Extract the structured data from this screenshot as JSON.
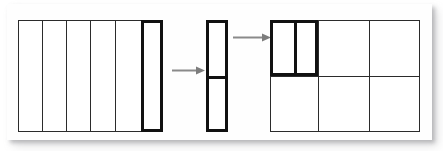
{
  "figure": {
    "title": "",
    "background_color": "#ffffff",
    "frame_color": "#ffffff",
    "line_color": "#2b2b2b",
    "highlight_color": "#111111",
    "arrow_color": "#808080"
  },
  "panels": [
    {
      "id": "panel-left",
      "name": "source-grid-6-columns",
      "x": 18,
      "y": 20,
      "width": 145,
      "height": 112,
      "columns": 6,
      "rows": 1,
      "column_dividers_x": [
        42,
        66,
        90,
        115,
        141
      ],
      "highlighted_cell": {
        "index": 5,
        "x": 141,
        "y": 20,
        "width": 22,
        "height": 112,
        "border_weight": 3
      }
    },
    {
      "id": "panel-middle",
      "name": "extracted-strip-split-in-two",
      "x": 206,
      "y": 20,
      "width": 22,
      "height": 112,
      "border_weight": 3,
      "row_dividers_y": [
        76
      ],
      "segments": 2
    },
    {
      "id": "panel-right",
      "name": "target-grid-3x2",
      "x": 270,
      "y": 20,
      "width": 150,
      "height": 112,
      "columns": 3,
      "rows": 2,
      "column_dividers_x": [
        318,
        369
      ],
      "row_dividers_y": [
        76
      ],
      "highlighted_cell": {
        "index": 0,
        "x": 270,
        "y": 20,
        "width": 48,
        "height": 56,
        "border_weight": 3,
        "sub_divider_x": 294,
        "sub_columns": 2
      }
    }
  ],
  "arrows": [
    {
      "id": "arrow-1",
      "name": "arrow-left-to-middle",
      "label": "",
      "x": 172,
      "y": 65,
      "length": 29,
      "direction": "right"
    },
    {
      "id": "arrow-2",
      "name": "arrow-middle-to-right",
      "label": "",
      "x": 233,
      "y": 32,
      "length": 34,
      "direction": "right"
    }
  ]
}
